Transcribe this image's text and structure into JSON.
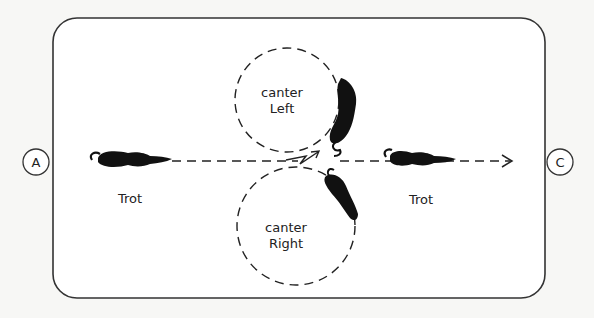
{
  "diagram": {
    "title": "",
    "arena": {
      "stroke": "#333333",
      "background": "#ffffff"
    },
    "markers": {
      "left": "A",
      "right": "C"
    },
    "labels": {
      "trot_left": "Trot",
      "trot_right": "Trot",
      "canter_left_line1": "canter",
      "canter_left_line2": "Left",
      "canter_right_line1": "canter",
      "canter_right_line2": "Right"
    },
    "circles": [
      {
        "name": "canter-left-circle",
        "label": "canter Left"
      },
      {
        "name": "canter-right-circle",
        "label": "canter Right"
      }
    ],
    "path": {
      "style": "dashed",
      "direction": "A to C"
    },
    "horses": [
      {
        "name": "horse-trot-left",
        "gait": "Trot"
      },
      {
        "name": "horse-canter-left",
        "gait": "canter Left"
      },
      {
        "name": "horse-canter-right",
        "gait": "canter Right"
      },
      {
        "name": "horse-trot-right",
        "gait": "Trot"
      }
    ],
    "colors": {
      "ink": "#1a1a1a",
      "paper": "#f7f7f5"
    }
  }
}
